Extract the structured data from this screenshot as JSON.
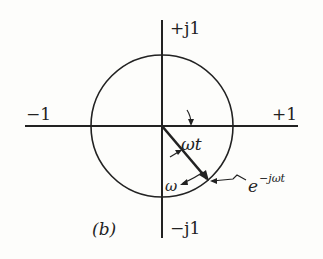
{
  "diagram": {
    "panel_label": "(b)",
    "axes": {
      "positive_imag": "+j1",
      "negative_imag": "−j1",
      "negative_real": "−1",
      "positive_real": "+1"
    },
    "annotations": {
      "angle": "ωt",
      "angular_velocity": "ω",
      "phasor_base": "e",
      "phasor_exponent": "−jωt"
    },
    "colors": {
      "ink": "#222222",
      "background": "#fdfdfb"
    }
  }
}
